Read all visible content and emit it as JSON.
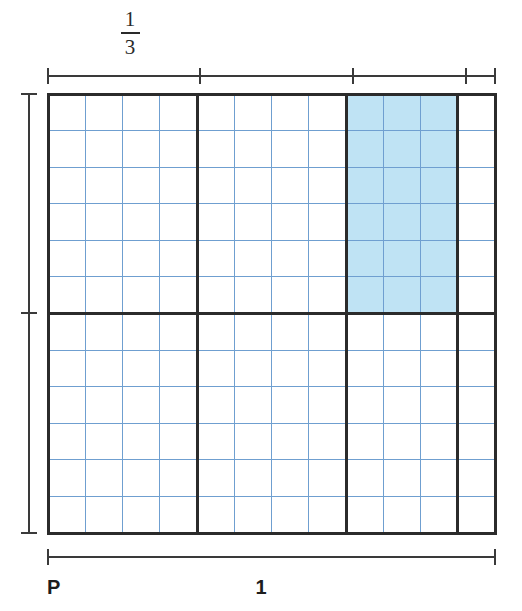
{
  "figure": {
    "background_color": "#ffffff"
  },
  "colors": {
    "shade_fill": "#bfe3f4",
    "thin_grid": "#6f9fd0",
    "thick_grid": "#2b2b2b",
    "ruler": "#3a3a3a",
    "text": "#1d1d1d"
  },
  "labels": {
    "top_fraction_numerator": "1",
    "top_fraction_denominator": "3",
    "bottom_left": "P",
    "bottom_center": "1"
  },
  "grid": {
    "left": 48,
    "top": 94,
    "right": 495,
    "bottom": 533,
    "columns": 12,
    "rows": 12,
    "thick_column_divisions": [
      4,
      8,
      11
    ],
    "thick_row_divisions": [
      6
    ],
    "thin_line_width": 1,
    "thick_line_width": 3
  },
  "shaded_region": {
    "col_start": 8,
    "col_end": 11,
    "row_start": 0,
    "row_end": 6,
    "columns_covered": 3,
    "rows_covered": 6,
    "fill": "#bfe3f4"
  },
  "rulers": {
    "top": {
      "y": 76,
      "x_start": 48,
      "x_end": 495,
      "tick_positions": [
        48,
        200,
        353,
        466,
        495
      ],
      "tick_half_height": 8
    },
    "left": {
      "x": 29,
      "y_start": 94,
      "y_end": 533,
      "tick_positions": [
        94,
        313,
        533
      ],
      "tick_half_width": 8
    },
    "bottom": {
      "y": 557,
      "x_start": 48,
      "x_end": 495,
      "tick_positions": [
        48,
        495
      ],
      "tick_half_height": 8
    }
  },
  "chart_data": {
    "type": "area_model",
    "xlabel": "1",
    "ylabel": "",
    "x_axis_origin_label": "P",
    "x_total": 1,
    "y_total": 1,
    "cell_fraction_width": "1/12",
    "cell_fraction_height": "1/12",
    "top_segment_label": "1/3",
    "top_segment_width_cells": 4,
    "partitions_x_cells": [
      4,
      4,
      3,
      1
    ],
    "partitions_y_cells": [
      6,
      6
    ],
    "shaded_cells": 18,
    "shaded_fraction_of_whole": "18/144",
    "shaded_width_fraction": "3/12",
    "shaded_height_fraction": "6/12",
    "grid": true,
    "legend": "none"
  }
}
